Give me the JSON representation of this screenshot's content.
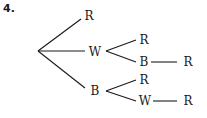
{
  "problem_number": "4.",
  "tree": {
    "root": {
      "x": 38,
      "y": 51
    },
    "nodes": [
      {
        "id": "n1",
        "label": "R",
        "x": 89,
        "y": 16
      },
      {
        "id": "n2",
        "label": "W",
        "x": 95,
        "y": 52
      },
      {
        "id": "n3",
        "label": "B",
        "x": 95,
        "y": 91
      },
      {
        "id": "n4",
        "label": "R",
        "x": 144,
        "y": 40
      },
      {
        "id": "n5",
        "label": "B",
        "x": 144,
        "y": 62
      },
      {
        "id": "n6",
        "label": "R",
        "x": 188,
        "y": 62
      },
      {
        "id": "n7",
        "label": "R",
        "x": 144,
        "y": 80
      },
      {
        "id": "n8",
        "label": "W",
        "x": 145,
        "y": 101
      },
      {
        "id": "n9",
        "label": "R",
        "x": 188,
        "y": 101
      }
    ],
    "edges": [
      {
        "from": "root",
        "to": "n1",
        "x1": 38,
        "y1": 51,
        "x2": 81,
        "y2": 19
      },
      {
        "from": "root",
        "to": "n2",
        "x1": 38,
        "y1": 51,
        "x2": 85,
        "y2": 51
      },
      {
        "from": "root",
        "to": "n3",
        "x1": 38,
        "y1": 51,
        "x2": 85,
        "y2": 88
      },
      {
        "from": "n2",
        "to": "n4",
        "x1": 106,
        "y1": 51,
        "x2": 136,
        "y2": 40
      },
      {
        "from": "n2",
        "to": "n5",
        "x1": 106,
        "y1": 51,
        "x2": 136,
        "y2": 62
      },
      {
        "from": "n5",
        "to": "n6",
        "x1": 151,
        "y1": 62,
        "x2": 177,
        "y2": 62
      },
      {
        "from": "n3",
        "to": "n7",
        "x1": 106,
        "y1": 91,
        "x2": 136,
        "y2": 80
      },
      {
        "from": "n3",
        "to": "n8",
        "x1": 106,
        "y1": 91,
        "x2": 136,
        "y2": 101
      },
      {
        "from": "n8",
        "to": "n9",
        "x1": 153,
        "y1": 101,
        "x2": 177,
        "y2": 101
      }
    ]
  },
  "colors": {
    "line": "#1a1a1a",
    "text": "#1a1a1a",
    "background": "#ffffff"
  }
}
